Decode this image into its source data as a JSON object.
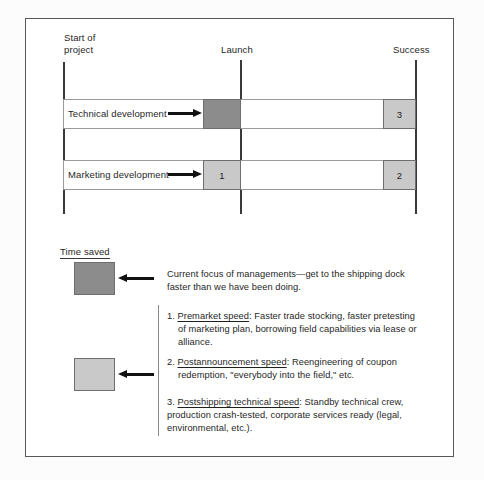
{
  "figure": {
    "background_color": "#ffffff",
    "border_color": "#595959"
  },
  "timeline": {
    "milestones": [
      {
        "id": "start",
        "label": "Start of\nproject"
      },
      {
        "id": "launch",
        "label": "Launch"
      },
      {
        "id": "success",
        "label": "Success"
      }
    ],
    "rows": [
      {
        "id": "technical-development",
        "label": "Technical development",
        "segments": [
          {
            "id": "tech-premarket",
            "value": "",
            "color": "#8c8c8c"
          },
          {
            "id": "tech-postshipping",
            "value": "3",
            "color": "#c9c9c9"
          }
        ]
      },
      {
        "id": "marketing-development",
        "label": "Marketing development",
        "segments": [
          {
            "id": "mktg-premarket",
            "value": "1",
            "color": "#c9c9c9"
          },
          {
            "id": "mktg-postannouncement",
            "value": "2",
            "color": "#c9c9c9"
          }
        ]
      }
    ]
  },
  "legend": {
    "title": "Time saved",
    "swatches": [
      {
        "id": "dark-swatch",
        "color": "#8c8c8c"
      },
      {
        "id": "light-swatch",
        "color": "#c9c9c9"
      }
    ],
    "note": "Current focus of managements—get to the shipping dock faster than we have been doing.",
    "items": [
      {
        "number": "1.",
        "term": "Premarket speed",
        "text": ": Faster trade stocking, faster pretesting of marketing plan, borrowing field capabilities via lease or alliance."
      },
      {
        "number": "2.",
        "term": "Postannouncement speed",
        "text": ": Reengineering of coupon redemption, \"everybody into the field,\" etc."
      },
      {
        "number": "3.",
        "term": "Postshipping technical speed",
        "text": ": Standby technical crew, production crash-tested, corporate services ready (legal, environmental, etc.)."
      }
    ]
  }
}
